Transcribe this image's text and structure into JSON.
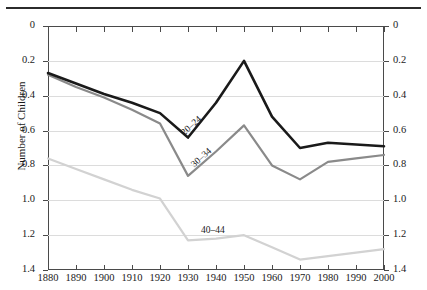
{
  "figure": {
    "axis_title_y": "Number of Children",
    "y_ticks": [
      "1.4",
      "1.2",
      "1.0",
      "0.8",
      "0.6",
      "0.4",
      "0.2",
      "0"
    ],
    "x_ticks": [
      "1880",
      "1890",
      "1900",
      "1910",
      "1920",
      "1930",
      "1940",
      "1950",
      "1960",
      "1970",
      "1980",
      "1990",
      "2000"
    ],
    "series_labels": {
      "s1": "20–24",
      "s2": "30–34",
      "s3": "40–44"
    },
    "colors": {
      "series_20_24": "#1a1a1a",
      "series_30_34": "#8a8a8a",
      "series_40_44": "#d2d2d2",
      "grid": "#dcdcdc",
      "axis": "#4a4a4a",
      "rule": "#2b2b2b"
    }
  },
  "chart_data": {
    "type": "line",
    "title": "",
    "xlabel": "",
    "ylabel": "Number of Children",
    "xlim": [
      1880,
      2000
    ],
    "ylim": [
      0,
      1.4
    ],
    "ytick_values": [
      0,
      0.2,
      0.4,
      0.6,
      0.8,
      1.0,
      1.2,
      1.4
    ],
    "grid": true,
    "legend": "inline-labels",
    "x": [
      1880,
      1890,
      1900,
      1910,
      1920,
      1930,
      1940,
      1950,
      1960,
      1970,
      1980,
      1990,
      2000
    ],
    "series": [
      {
        "name": "20–24",
        "color": "#1a1a1a",
        "values": [
          1.13,
          1.07,
          1.01,
          0.96,
          0.9,
          0.76,
          0.96,
          1.2,
          0.88,
          0.7,
          0.73,
          0.72,
          0.71
        ]
      },
      {
        "name": "30–34",
        "color": "#8a8a8a",
        "values": [
          1.12,
          1.05,
          0.99,
          0.92,
          0.84,
          0.54,
          0.68,
          0.83,
          0.6,
          0.52,
          0.62,
          0.64,
          0.66
        ]
      },
      {
        "name": "40–44",
        "color": "#d2d2d2",
        "values": [
          0.64,
          0.58,
          0.52,
          0.46,
          0.41,
          0.17,
          0.18,
          0.2,
          0.13,
          0.06,
          0.08,
          0.1,
          0.12
        ]
      }
    ]
  }
}
